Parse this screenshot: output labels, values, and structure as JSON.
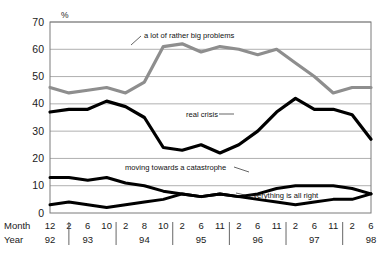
{
  "chart_data": {
    "type": "line",
    "title": "",
    "xlabel": "",
    "ylabel": "%",
    "unit_label": "%",
    "ylim": [
      0,
      70
    ],
    "ytick_values": [
      0,
      10,
      20,
      30,
      40,
      50,
      60,
      70
    ],
    "ytick_labels": [
      "0",
      "10",
      "20",
      "30",
      "40",
      "50",
      "60",
      "70"
    ],
    "grid": true,
    "legend_position": "inline-annotations",
    "row_headers": {
      "month": "Month",
      "year": "Year"
    },
    "x_months": [
      "12",
      "2",
      "6",
      "10",
      "2",
      "8",
      "10",
      "2",
      "6",
      "11",
      "2",
      "6",
      "11",
      "2",
      "6",
      "11",
      "2",
      "6"
    ],
    "x_years": [
      "92",
      "93",
      "94",
      "95",
      "96",
      "97",
      "98"
    ],
    "x_year_positions": [
      0,
      2,
      5,
      8,
      11,
      14,
      17
    ],
    "series": [
      {
        "name": "a lot of rather big problems",
        "color": "#8e8e8e",
        "values": [
          46,
          44,
          45,
          46,
          44,
          48,
          61,
          62,
          59,
          61,
          60,
          58,
          60,
          55,
          50,
          44,
          46,
          46
        ]
      },
      {
        "name": "real crisis",
        "color": "#000000",
        "values": [
          37,
          38,
          38,
          41,
          39,
          35,
          24,
          23,
          25,
          22,
          25,
          30,
          37,
          42,
          38,
          38,
          36,
          27
        ]
      },
      {
        "name": "moving towards a catastrophe",
        "color": "#000000",
        "values": [
          13,
          13,
          12,
          13,
          11,
          10,
          8,
          7,
          6,
          7,
          6,
          7,
          9,
          10,
          10,
          10,
          9,
          7
        ]
      },
      {
        "name": "everything is all right",
        "color": "#000000",
        "values": [
          3,
          4,
          3,
          2,
          3,
          4,
          5,
          7,
          6,
          7,
          6,
          5,
          4,
          3,
          4,
          5,
          5,
          7
        ]
      }
    ],
    "annotations": [
      {
        "text": "a lot of rather big problems",
        "series": "a lot of rather big problems"
      },
      {
        "text": "real crisis",
        "series": "real crisis"
      },
      {
        "text": "moving towards a catastrophe",
        "series": "moving towards a catastrophe"
      },
      {
        "text": "everything is all right",
        "series": "everything is all right"
      }
    ]
  }
}
